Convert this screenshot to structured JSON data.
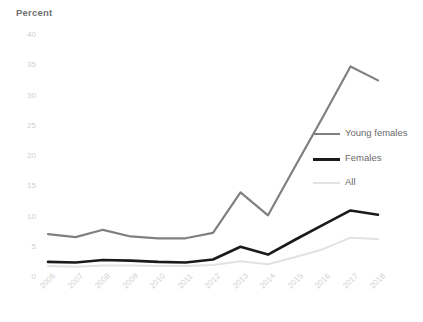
{
  "chart_data": {
    "type": "line",
    "title": "",
    "ylabel": "Percent",
    "xlabel": "",
    "ylim": [
      0,
      40
    ],
    "ytick_values": [
      0,
      5,
      10,
      15,
      20,
      25,
      30,
      35,
      40
    ],
    "ytick_labels": [
      "0",
      "5",
      "10",
      "15",
      "20",
      "25",
      "30",
      "35",
      "40"
    ],
    "grid": false,
    "legend_position": "inside-right",
    "categories": [
      "2006",
      "2007",
      "2008",
      "2009",
      "2010",
      "2011",
      "2012",
      "2013",
      "2014",
      "2015",
      "2016",
      "2017",
      "2018"
    ],
    "series": [
      {
        "name": "Young females",
        "color": "#808080",
        "width": 2.2,
        "values": [
          7.1,
          6.6,
          7.8,
          6.7,
          6.4,
          6.4,
          7.3,
          14.0,
          10.2,
          18.4,
          26.5,
          34.8,
          32.5
        ]
      },
      {
        "name": "Females",
        "color": "#1a1a1a",
        "width": 2.6,
        "values": [
          2.5,
          2.4,
          2.8,
          2.7,
          2.5,
          2.4,
          2.9,
          5.0,
          3.7,
          6.2,
          8.6,
          11.0,
          10.3
        ]
      },
      {
        "name": "All",
        "color": "#e2e2e2",
        "width": 2.0,
        "values": [
          1.8,
          1.7,
          1.9,
          1.9,
          1.8,
          1.8,
          2.0,
          2.6,
          2.1,
          3.3,
          4.6,
          6.5,
          6.3
        ]
      }
    ]
  },
  "legend": {
    "items": [
      {
        "label": "Young females",
        "color": "#808080"
      },
      {
        "label": "Females",
        "color": "#1a1a1a"
      },
      {
        "label": "All",
        "color": "#e2e2e2"
      }
    ]
  },
  "axes": {
    "y_title": "Percent"
  }
}
